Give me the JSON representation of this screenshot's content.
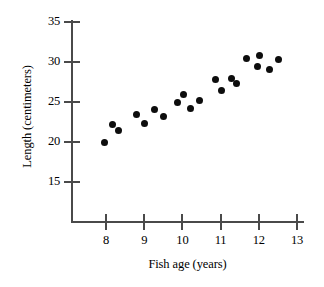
{
  "chart_data": {
    "type": "scatter",
    "title": "",
    "xlabel": "Fish age (years)",
    "ylabel": "Length (centimeters)",
    "xlim": [
      7.6,
      13.2
    ],
    "ylim": [
      13.0,
      35.8
    ],
    "xticks": [
      8,
      9,
      10,
      11,
      12,
      13
    ],
    "yticks": [
      15,
      20,
      25,
      30,
      35
    ],
    "xtick_labels": [
      "8",
      "9",
      "10",
      "11",
      "12",
      "13"
    ],
    "ytick_labels": [
      "15",
      "20",
      "25",
      "30",
      "35"
    ],
    "grid": false,
    "legend": null,
    "marker": "filled-circle",
    "marker_color": "#0d0d0d",
    "axis_color": "#4a4a4a",
    "points": [
      {
        "x": 7.95,
        "y": 20.0
      },
      {
        "x": 8.18,
        "y": 22.2
      },
      {
        "x": 8.34,
        "y": 21.4
      },
      {
        "x": 8.81,
        "y": 23.5
      },
      {
        "x": 9.02,
        "y": 22.3
      },
      {
        "x": 9.28,
        "y": 24.1
      },
      {
        "x": 9.51,
        "y": 23.2
      },
      {
        "x": 9.86,
        "y": 24.9
      },
      {
        "x": 10.02,
        "y": 25.9
      },
      {
        "x": 10.21,
        "y": 24.2
      },
      {
        "x": 10.44,
        "y": 25.2
      },
      {
        "x": 10.86,
        "y": 27.8
      },
      {
        "x": 11.02,
        "y": 26.5
      },
      {
        "x": 11.28,
        "y": 27.9
      },
      {
        "x": 11.42,
        "y": 27.3
      },
      {
        "x": 11.68,
        "y": 30.4
      },
      {
        "x": 11.97,
        "y": 29.4
      },
      {
        "x": 12.03,
        "y": 30.8
      },
      {
        "x": 12.28,
        "y": 29.1
      },
      {
        "x": 12.52,
        "y": 30.3
      }
    ]
  }
}
